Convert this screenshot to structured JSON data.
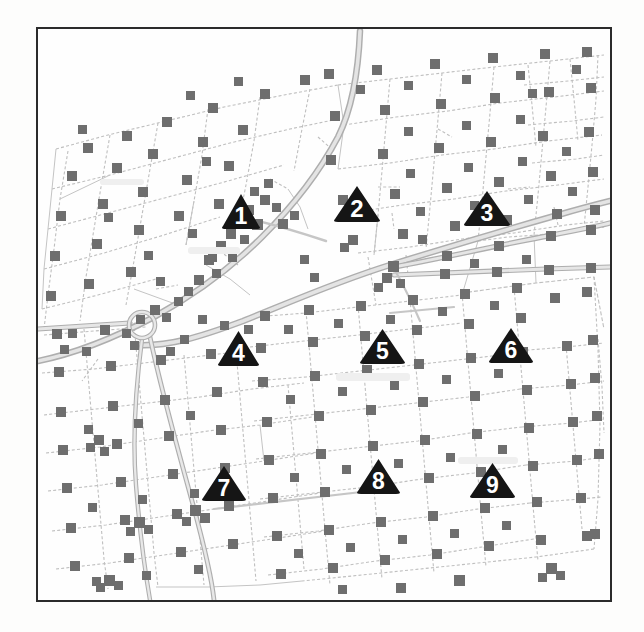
{
  "figure": {
    "kind": "scanned-cadastral-map",
    "background_color": "#fdfdfc",
    "frame": {
      "border_color": "#2b2b2b",
      "border_width_px": 2,
      "x": 36,
      "y": 27,
      "width": 576,
      "height": 575
    },
    "colors": {
      "parcel_line": "#b9b9b9",
      "parcel_line_faint": "#cfcfcf",
      "road_fill": "#d2d2d2",
      "road_edge": "#a8a8a8",
      "building_marker": "#6e6e6e",
      "marker_triangle": "#151515",
      "marker_number": "#ffffff",
      "paper": "#fefefe"
    }
  },
  "map": {
    "title": "",
    "legend": [],
    "site_markers": [
      {
        "id": "site-1",
        "label": "1",
        "icon": "triangle-marker-icon",
        "x": 203,
        "y": 181,
        "width": 42,
        "height": 37
      },
      {
        "id": "site-2",
        "label": "2",
        "icon": "triangle-marker-icon",
        "x": 319,
        "y": 174,
        "width": 50,
        "height": 38
      },
      {
        "id": "site-3",
        "label": "3",
        "icon": "triangle-marker-icon",
        "x": 449,
        "y": 178,
        "width": 50,
        "height": 37
      },
      {
        "id": "site-4",
        "label": "4",
        "icon": "triangle-marker-icon",
        "x": 200,
        "y": 318,
        "width": 45,
        "height": 37
      },
      {
        "id": "site-5",
        "label": "5",
        "icon": "triangle-marker-icon",
        "x": 344,
        "y": 316,
        "width": 49,
        "height": 37
      },
      {
        "id": "site-6",
        "label": "6",
        "icon": "triangle-marker-icon",
        "x": 473,
        "y": 315,
        "width": 48,
        "height": 37
      },
      {
        "id": "site-7",
        "label": "7",
        "icon": "triangle-marker-icon",
        "x": 186,
        "y": 453,
        "width": 48,
        "height": 37
      },
      {
        "id": "site-8",
        "label": "8",
        "icon": "triangle-marker-icon",
        "x": 340,
        "y": 446,
        "width": 47,
        "height": 37
      },
      {
        "id": "site-9",
        "label": "9",
        "icon": "triangle-marker-icon",
        "x": 454,
        "y": 450,
        "width": 49,
        "height": 37
      }
    ],
    "roads": [
      {
        "name": "primary-diagonal-northeast",
        "type": "highway",
        "points": "96,316 150,318 205,300 262,272 300,253 352,236 400,222 420,210 470,196 520,182 566,170 600,162",
        "width": 5
      },
      {
        "name": "primary-diagonal-northwest",
        "type": "highway",
        "points": "8,330 60,318 108,300 152,282 196,254 232,222 266,182 296,140 318,108 330,80 340,48 346,10",
        "width": 5
      },
      {
        "name": "mid-corridor-east",
        "type": "arterial",
        "points": "370,232 420,222 470,212 520,204 570,196 606,192",
        "width": 4
      },
      {
        "name": "mid-corridor-east-lower",
        "type": "arterial",
        "points": "370,248 424,244 478,242 530,240 578,238 606,238",
        "width": 4
      },
      {
        "name": "roundabout-approach-west",
        "type": "arterial",
        "points": "6,302 48,300 86,296 104,294",
        "width": 4
      },
      {
        "name": "roundabout-spur-south",
        "type": "local",
        "points": "118,306 130,360 146,420 160,480 170,540 176,578",
        "width": 3
      },
      {
        "name": "roundabout-spur-southwest",
        "type": "local",
        "points": "110,306 96,360 90,410 96,462 104,520 110,570",
        "width": 3
      }
    ],
    "roundabout": {
      "name": "roundabout",
      "cx": 104,
      "cy": 296,
      "r": 13
    },
    "parcel_grid_note": "irregular surveyed parcel blocks with dotted boundary lines",
    "building_marker_count": 214
  }
}
